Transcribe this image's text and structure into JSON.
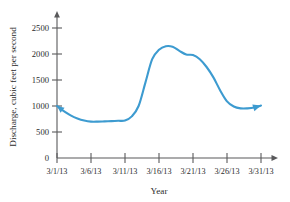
{
  "chart_data": {
    "type": "line",
    "title": "",
    "xlabel": "Year",
    "ylabel": "Discharge, cubic feet per second",
    "categories": [
      "3/1/13",
      "3/6/13",
      "3/11/13",
      "3/16/13",
      "3/21/13",
      "3/26/13",
      "3/31/13"
    ],
    "xtick_labels": [
      "3/1/13",
      "3/6/13",
      "3/11/13",
      "3/16/13",
      "3/21/13",
      "3/26/13",
      "3/31/13"
    ],
    "ytick_labels": [
      "0",
      "500",
      "1000",
      "1500",
      "2000",
      "2500"
    ],
    "ytick_values": [
      0,
      500,
      1000,
      1500,
      2000,
      2500
    ],
    "ylim": [
      0,
      2750
    ],
    "xlim": [
      "3/1/13",
      "3/31/13"
    ],
    "grid": false,
    "legend": "none",
    "series": [
      {
        "name": "Discharge",
        "color": "#3d9bd0",
        "start_arrow": true,
        "end_arrow": true,
        "x": [
          "3/1/13",
          "3/2/13",
          "3/3/13",
          "3/4/13",
          "3/5/13",
          "3/6/13",
          "3/7/13",
          "3/8/13",
          "3/9/13",
          "3/10/13",
          "3/11/13",
          "3/12/13",
          "3/13/13",
          "3/14/13",
          "3/15/13",
          "3/16/13",
          "3/17/13",
          "3/18/13",
          "3/19/13",
          "3/20/13",
          "3/21/13",
          "3/22/13",
          "3/23/13",
          "3/24/13",
          "3/25/13",
          "3/26/13",
          "3/27/13",
          "3/28/13",
          "3/29/13",
          "3/30/13",
          "3/31/13"
        ],
        "values": [
          1000,
          900,
          820,
          760,
          720,
          700,
          700,
          705,
          710,
          715,
          720,
          800,
          1000,
          1450,
          1900,
          2080,
          2150,
          2140,
          2060,
          1990,
          1980,
          1900,
          1750,
          1550,
          1300,
          1090,
          990,
          955,
          955,
          970,
          1010
        ]
      }
    ],
    "colors": {
      "curve": "#3d9bd0",
      "axis": "#59595b",
      "text": "#2b2b2b",
      "background": "#ffffff"
    }
  }
}
